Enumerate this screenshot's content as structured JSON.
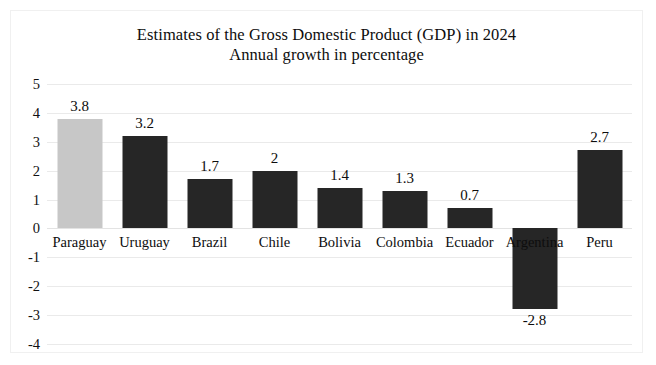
{
  "chart_data": {
    "type": "bar",
    "title": "Estimates of the Gross Domestic Product (GDP) in 2024",
    "subtitle": "Annual growth in percentage",
    "xlabel": "",
    "ylabel": "",
    "ylim": [
      -4,
      5
    ],
    "ytick_labels": [
      "5",
      "4",
      "3",
      "2",
      "1",
      "0",
      "-1",
      "-2",
      "-3",
      "-4"
    ],
    "ytick_values": [
      5,
      4,
      3,
      2,
      1,
      0,
      -1,
      -2,
      -3,
      -4
    ],
    "grid": true,
    "legend": "none",
    "categories": [
      "Paraguay",
      "Uruguay",
      "Brazil",
      "Chile",
      "Bolivia",
      "Colombia",
      "Ecuador",
      "Argentina",
      "Peru"
    ],
    "values": [
      3.8,
      3.2,
      1.7,
      2,
      1.4,
      1.3,
      0.7,
      -2.8,
      2.7
    ],
    "value_labels": [
      "3.8",
      "3.2",
      "1.7",
      "2",
      "1.4",
      "1.3",
      "0.7",
      "-2.8",
      "2.7"
    ],
    "bar_colors": [
      "#c7c7c7",
      "#262626",
      "#262626",
      "#262626",
      "#262626",
      "#262626",
      "#262626",
      "#262626",
      "#262626"
    ],
    "highlight_category": "Paraguay",
    "highlight_color": "#c7c7c7",
    "bar_color": "#262626",
    "grid_color": "#eaeaea",
    "background": "#ffffff"
  },
  "chart_titles": {
    "line1": "Estimates of the Gross Domestic Product (GDP) in 2024",
    "line2": "Annual growth in percentage"
  }
}
